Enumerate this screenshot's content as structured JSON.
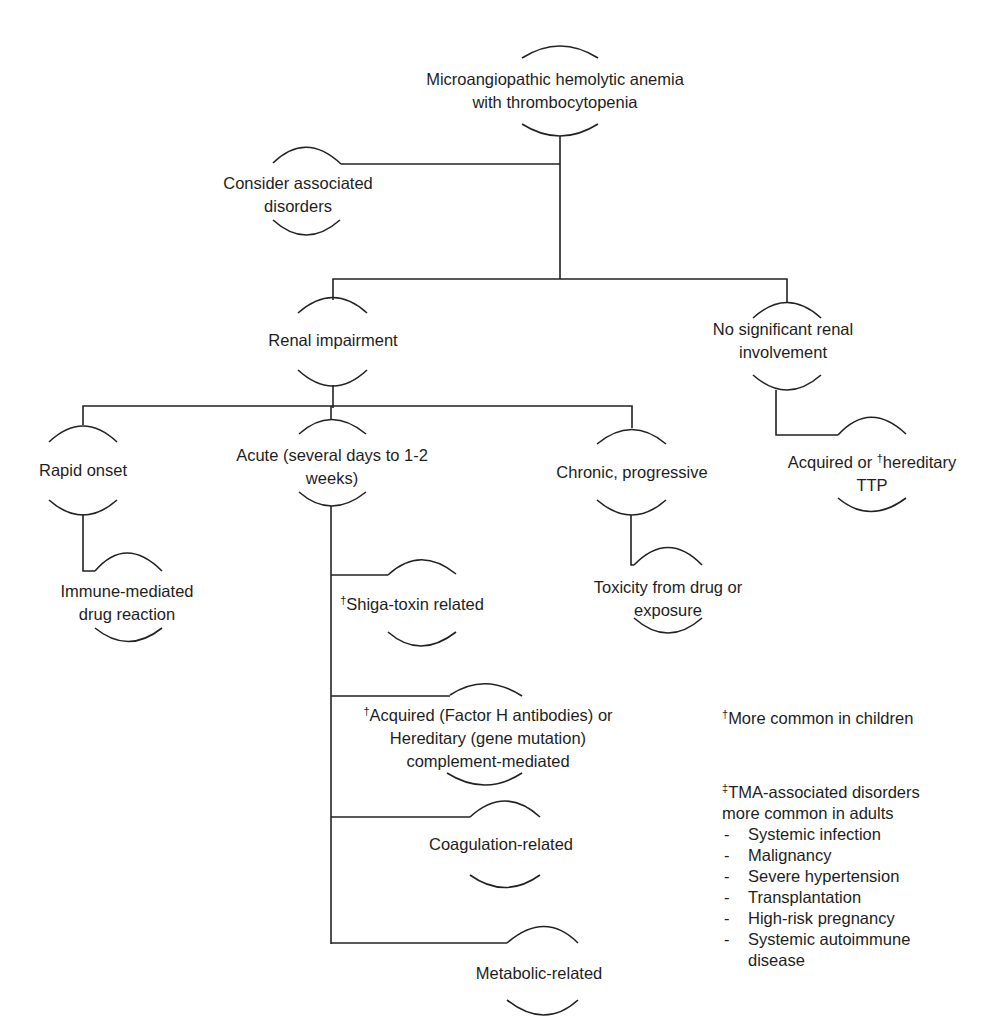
{
  "diagram": {
    "root": {
      "lines": [
        "Microangiopathic hemolytic anemia",
        "with thrombocytopenia"
      ]
    },
    "associated": {
      "lines": [
        "Consider associated",
        "disorders"
      ]
    },
    "renal_impairment": {
      "lines": [
        "Renal impairment"
      ]
    },
    "no_renal": {
      "lines": [
        "No significant renal",
        "involvement"
      ]
    },
    "ttp": {
      "mark": "†",
      "lines": [
        "Acquired or ",
        "hereditary",
        "TTP"
      ]
    },
    "rapid_onset": {
      "lines": [
        "Rapid onset"
      ]
    },
    "immune_drug": {
      "lines": [
        "Immune-mediated",
        "drug reaction"
      ]
    },
    "acute": {
      "lines": [
        "Acute (several days to 1-2",
        "weeks)"
      ]
    },
    "chronic": {
      "lines": [
        "Chronic, progressive"
      ]
    },
    "toxicity": {
      "lines": [
        "Toxicity from drug or",
        "exposure"
      ]
    },
    "shiga": {
      "mark": "†",
      "lines": [
        "Shiga-toxin related"
      ]
    },
    "complement": {
      "mark": "†",
      "lines": [
        "Acquired (Factor H antibodies) or",
        "Hereditary (gene mutation)",
        "complement-mediated"
      ]
    },
    "coagulation": {
      "lines": [
        "Coagulation-related"
      ]
    },
    "metabolic": {
      "lines": [
        "Metabolic-related"
      ]
    }
  },
  "legend": {
    "children_note": {
      "mark": "†",
      "text": "More common in children"
    },
    "adults_note": {
      "mark": "‡",
      "title_lines": [
        "TMA-associated disorders",
        "more common in adults"
      ],
      "dash": "-",
      "items": [
        "Systemic infection",
        "Malignancy",
        "Severe hypertension",
        "Transplantation",
        "High-risk pregnancy",
        "Systemic autoimmune",
        "disease"
      ]
    }
  }
}
